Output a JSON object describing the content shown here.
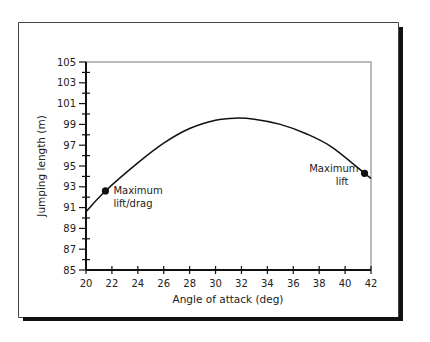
{
  "chart_data": {
    "type": "line",
    "title": "",
    "xlabel": "Angle of attack (deg)",
    "ylabel": "Jumping length (m)",
    "xlim": [
      20,
      42
    ],
    "ylim": [
      85,
      105
    ],
    "x_ticks": [
      20,
      22,
      24,
      26,
      28,
      30,
      32,
      34,
      36,
      38,
      40,
      42
    ],
    "y_ticks": [
      85,
      87,
      89,
      91,
      93,
      95,
      97,
      99,
      101,
      103,
      105
    ],
    "grid": false,
    "legend": null,
    "series": [
      {
        "name": "Jumping length",
        "x": [
          20,
          21.5,
          24,
          26,
          28,
          30,
          31.5,
          33,
          35,
          37,
          39,
          41.5,
          42
        ],
        "y": [
          90.6,
          92.6,
          95.3,
          97.2,
          98.6,
          99.4,
          99.6,
          99.5,
          99.0,
          98.1,
          96.8,
          94.3,
          93.8
        ]
      }
    ],
    "annotations": [
      {
        "label_line1": "Maximum",
        "label_line2": "lift/drag",
        "x": 21.5,
        "y": 92.6
      },
      {
        "label_line1": "Maximum",
        "label_line2": "lift",
        "x": 41.5,
        "y": 94.3
      }
    ]
  }
}
